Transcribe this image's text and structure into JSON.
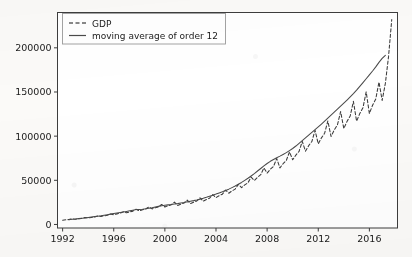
{
  "chart_data": {
    "type": "line",
    "title": "",
    "xlabel": "",
    "ylabel": "",
    "xlim": [
      1991.6,
      2018.2
    ],
    "ylim": [
      -4000,
      240000
    ],
    "grid": false,
    "legend_position": "upper left",
    "xticks": [
      "1992",
      "1996",
      "2000",
      "2004",
      "2008",
      "2012",
      "2016"
    ],
    "xtick_values": [
      1992,
      1996,
      2000,
      2004,
      2008,
      2012,
      2016
    ],
    "yticks": [
      "0",
      "50000",
      "100000",
      "150000",
      "200000"
    ],
    "ytick_values": [
      0,
      50000,
      100000,
      150000,
      200000
    ],
    "series": [
      {
        "name": "GDP",
        "style": "dashed",
        "color": "#3a3a3a",
        "x": [
          1992.0,
          1992.25,
          1992.5,
          1992.75,
          1993.0,
          1993.25,
          1993.5,
          1993.75,
          1994.0,
          1994.25,
          1994.5,
          1994.75,
          1995.0,
          1995.25,
          1995.5,
          1995.75,
          1996.0,
          1996.25,
          1996.5,
          1996.75,
          1997.0,
          1997.25,
          1997.5,
          1997.75,
          1998.0,
          1998.25,
          1998.5,
          1998.75,
          1999.0,
          1999.25,
          1999.5,
          1999.75,
          2000.0,
          2000.25,
          2000.5,
          2000.75,
          2001.0,
          2001.25,
          2001.5,
          2001.75,
          2002.0,
          2002.25,
          2002.5,
          2002.75,
          2003.0,
          2003.25,
          2003.5,
          2003.75,
          2004.0,
          2004.25,
          2004.5,
          2004.75,
          2005.0,
          2005.25,
          2005.5,
          2005.75,
          2006.0,
          2006.25,
          2006.5,
          2006.75,
          2007.0,
          2007.25,
          2007.5,
          2007.75,
          2008.0,
          2008.25,
          2008.5,
          2008.75,
          2009.0,
          2009.25,
          2009.5,
          2009.75,
          2010.0,
          2010.25,
          2010.5,
          2010.75,
          2011.0,
          2011.25,
          2011.5,
          2011.75,
          2012.0,
          2012.25,
          2012.5,
          2012.75,
          2013.0,
          2013.25,
          2013.5,
          2013.75,
          2014.0,
          2014.25,
          2014.5,
          2014.75,
          2015.0,
          2015.25,
          2015.5,
          2015.75,
          2016.0,
          2016.25,
          2016.5,
          2016.75,
          2017.0,
          2017.25,
          2017.5,
          2017.75
        ],
        "y": [
          4800,
          5300,
          5600,
          6400,
          5900,
          6500,
          6900,
          7900,
          7300,
          8000,
          8500,
          9700,
          9000,
          9800,
          10400,
          11900,
          11000,
          12000,
          12700,
          14500,
          13200,
          14300,
          15100,
          17200,
          15400,
          16600,
          17500,
          19900,
          17600,
          18900,
          19900,
          22600,
          19800,
          21200,
          22300,
          25300,
          21600,
          23100,
          24300,
          27600,
          23600,
          25300,
          26600,
          30200,
          26400,
          28300,
          29800,
          33800,
          30400,
          32600,
          34300,
          38900,
          35400,
          38000,
          40000,
          45400,
          41700,
          44800,
          47200,
          53500,
          49800,
          53500,
          56400,
          64000,
          58200,
          62500,
          65800,
          74700,
          64000,
          68800,
          72400,
          82200,
          73200,
          78600,
          82800,
          94000,
          83000,
          89200,
          93900,
          106600,
          91300,
          98100,
          103300,
          117200,
          99600,
          107000,
          112700,
          127900,
          108600,
          116700,
          122900,
          139400,
          116900,
          125600,
          132300,
          150100,
          125600,
          135000,
          142100,
          161300,
          140500,
          159700,
          190300,
          232000
        ]
      },
      {
        "name": "moving average of order 12",
        "style": "solid",
        "color": "#4a4a4a",
        "x": [
          1992.5,
          1992.75,
          1993.0,
          1993.25,
          1993.5,
          1993.75,
          1994.0,
          1994.25,
          1994.5,
          1994.75,
          1995.0,
          1995.25,
          1995.5,
          1995.75,
          1996.0,
          1996.25,
          1996.5,
          1996.75,
          1997.0,
          1997.25,
          1997.5,
          1997.75,
          1998.0,
          1998.25,
          1998.5,
          1998.75,
          1999.0,
          1999.25,
          1999.5,
          1999.75,
          2000.0,
          2000.25,
          2000.5,
          2000.75,
          2001.0,
          2001.25,
          2001.5,
          2001.75,
          2002.0,
          2002.25,
          2002.5,
          2002.75,
          2003.0,
          2003.25,
          2003.5,
          2003.75,
          2004.0,
          2004.25,
          2004.5,
          2004.75,
          2005.0,
          2005.25,
          2005.5,
          2005.75,
          2006.0,
          2006.25,
          2006.5,
          2006.75,
          2007.0,
          2007.25,
          2007.5,
          2007.75,
          2008.0,
          2008.25,
          2008.5,
          2008.75,
          2009.0,
          2009.25,
          2009.5,
          2009.75,
          2010.0,
          2010.25,
          2010.5,
          2010.75,
          2011.0,
          2011.25,
          2011.5,
          2011.75,
          2012.0,
          2012.25,
          2012.5,
          2012.75,
          2013.0,
          2013.25,
          2013.5,
          2013.75,
          2014.0,
          2014.25,
          2014.5,
          2014.75,
          2015.0,
          2015.25,
          2015.5,
          2015.75,
          2016.0,
          2016.25,
          2016.5,
          2016.75,
          2017.0,
          2017.25
        ],
        "y": [
          5500,
          5900,
          6200,
          6600,
          7000,
          7400,
          7900,
          8400,
          8900,
          9400,
          9900,
          10500,
          11100,
          11700,
          12300,
          12900,
          13500,
          14100,
          14800,
          15500,
          16200,
          16900,
          17000,
          17300,
          17700,
          18300,
          19000,
          19800,
          20500,
          21100,
          21700,
          22200,
          22600,
          23100,
          23600,
          24200,
          24800,
          25600,
          26300,
          27000,
          27800,
          28700,
          29700,
          30800,
          32000,
          33200,
          34400,
          35700,
          37000,
          38500,
          40000,
          41700,
          43500,
          45500,
          47600,
          49900,
          52300,
          54900,
          57600,
          60500,
          63400,
          66300,
          69000,
          71500,
          73600,
          75600,
          77400,
          79300,
          81300,
          83600,
          86000,
          88800,
          91800,
          94900,
          98000,
          101200,
          104300,
          107400,
          110500,
          113700,
          117000,
          120400,
          123800,
          127200,
          130600,
          134000,
          137400,
          140900,
          144500,
          148200,
          152100,
          156300,
          160600,
          165000,
          169400,
          173800,
          178400,
          183500,
          188000,
          191500
        ]
      }
    ]
  },
  "legend": {
    "entries": [
      {
        "label": "GDP",
        "marker": "dashed-line"
      },
      {
        "label": "moving average of order 12",
        "marker": "solid-line"
      }
    ]
  },
  "colors": {
    "background": "#fbfaf8",
    "axis": "#3d3d3d",
    "text": "#1a1a1a",
    "gdp_line": "#3a3a3a",
    "moving_average_line": "#4a4a4a",
    "legend_border": "#888888",
    "legend_face": "#ffffff"
  }
}
